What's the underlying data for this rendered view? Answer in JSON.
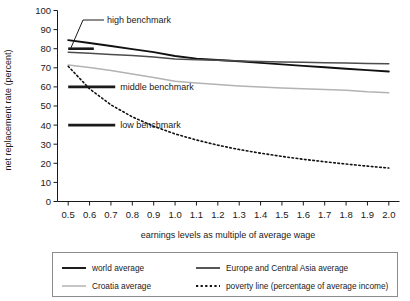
{
  "chart_data": {
    "type": "line",
    "title": "",
    "subtitle": "",
    "xlabel": "earnings levels as multiple of average wage",
    "ylabel": "net replacement rate (percent)",
    "xlim": [
      0.45,
      2.05
    ],
    "ylim": [
      0,
      100
    ],
    "grid": false,
    "legend_position": "bottom",
    "x": [
      0.5,
      0.6,
      0.7,
      0.8,
      0.9,
      1.0,
      1.1,
      1.2,
      1.3,
      1.4,
      1.5,
      1.6,
      1.7,
      1.8,
      1.9,
      2.0
    ],
    "xticks": [
      "0.5",
      "0.6",
      "0.7",
      "0.8",
      "0.9",
      "1.0",
      "1.1",
      "1.2",
      "1.3",
      "1.4",
      "1.5",
      "1.6",
      "1.7",
      "1.8",
      "1.9",
      "2.0"
    ],
    "yticks": [
      "0",
      "10",
      "20",
      "30",
      "40",
      "50",
      "60",
      "70",
      "80",
      "90",
      "100"
    ],
    "series": [
      {
        "name": "world average",
        "color": "#111111",
        "style": "solid",
        "width": 1.9,
        "values": [
          84.5,
          83.0,
          81.4,
          79.8,
          78.2,
          76.2,
          74.8,
          74.1,
          73.4,
          72.6,
          71.8,
          71.0,
          70.3,
          69.5,
          68.8,
          68.1
        ]
      },
      {
        "name": "Europe and Central Asia average",
        "color": "#4d4d4d",
        "style": "solid",
        "width": 1.5,
        "values": [
          78.2,
          77.6,
          77.0,
          76.4,
          75.6,
          74.6,
          74.2,
          73.9,
          73.6,
          73.3,
          73.1,
          72.9,
          72.7,
          72.5,
          72.3,
          72.1
        ]
      },
      {
        "name": "Croatia average",
        "color": "#b3b3b3",
        "style": "solid",
        "width": 1.5,
        "values": [
          71.5,
          70.2,
          68.6,
          66.8,
          64.9,
          63.0,
          62.0,
          61.2,
          60.5,
          59.9,
          59.4,
          59.0,
          58.6,
          58.2,
          57.4,
          57.0
        ]
      },
      {
        "name": "poverty line (percentage of average income)",
        "color": "#111111",
        "style": "dotted",
        "width": 1.6,
        "values": [
          70.8,
          59.0,
          50.6,
          44.3,
          39.4,
          35.4,
          32.2,
          29.5,
          27.2,
          25.3,
          23.6,
          22.1,
          20.8,
          19.6,
          18.5,
          17.5
        ]
      }
    ],
    "annotations": [
      {
        "name": "high benchmark",
        "label": "high benchmark",
        "value": 80,
        "x_start": 0.5,
        "x_end": 0.62
      },
      {
        "name": "middle benchmark",
        "label": "middle benchmark",
        "value": 60,
        "x_start": 0.5,
        "x_end": 0.72
      },
      {
        "name": "low benchmark",
        "label": "low benchmark",
        "value": 40,
        "x_start": 0.5,
        "x_end": 0.72
      }
    ]
  },
  "axes": {
    "y_title": "net replacement rate (percent)",
    "x_title": "earnings levels as multiple of average wage",
    "y_ticks": [
      "100",
      "90",
      "80",
      "70",
      "60",
      "50",
      "40",
      "30",
      "20",
      "10",
      "0"
    ],
    "x_ticks": [
      "0.5",
      "0.6",
      "0.7",
      "0.8",
      "0.9",
      "1.0",
      "1.1",
      "1.2",
      "1.3",
      "1.4",
      "1.5",
      "1.6",
      "1.7",
      "1.8",
      "1.9",
      "2.0"
    ]
  },
  "annotations": {
    "high": "high benchmark",
    "middle": "middle benchmark",
    "low": "low benchmark"
  },
  "legend": {
    "items": [
      {
        "label": "world average",
        "color": "#111111",
        "style": "solid"
      },
      {
        "label": "Europe and Central Asia average",
        "color": "#4d4d4d",
        "style": "solid"
      },
      {
        "label": "Croatia average",
        "color": "#b3b3b3",
        "style": "solid"
      },
      {
        "label": "poverty line (percentage of average income)",
        "color": "#111111",
        "style": "dotted"
      }
    ]
  }
}
